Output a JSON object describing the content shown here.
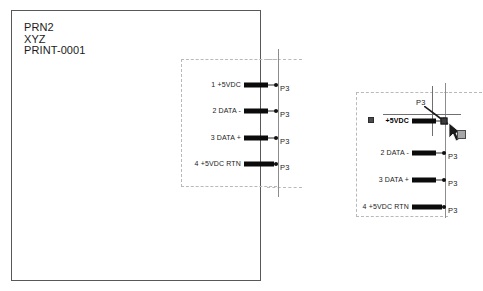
{
  "sheet": {
    "title_lines": [
      "PRN2",
      "XYZ",
      "PRINT-0001"
    ]
  },
  "pins": [
    {
      "number": "1",
      "signal": "+5VDC",
      "label": "1  +5VDC",
      "connector": "P3"
    },
    {
      "number": "2",
      "signal": "DATA -",
      "label": "2 DATA -",
      "connector": "P3"
    },
    {
      "number": "3",
      "signal": "DATA +",
      "label": "3 DATA +",
      "connector": "P3"
    },
    {
      "number": "4",
      "signal": "+5VDC RTN",
      "label": "4  +5VDC RTN",
      "connector": "P3"
    }
  ],
  "detail": {
    "selected_pin_label": "+5VDC",
    "selected_connector": "P3",
    "pins": [
      {
        "label": "2 DATA -",
        "connector": "P3"
      },
      {
        "label": "3 DATA +",
        "connector": "P3"
      },
      {
        "label": "4  +5VDC RTN",
        "connector": "P3"
      }
    ]
  },
  "colors": {
    "sheet_border": "#58585a",
    "bus_line": "#8d8d8f",
    "dashed_outline": "#b9b9bb",
    "pin_bar": "#0b0b0b",
    "selection": "#3c3c3e",
    "text": "#1b1b1b",
    "background": "#ffffff"
  }
}
